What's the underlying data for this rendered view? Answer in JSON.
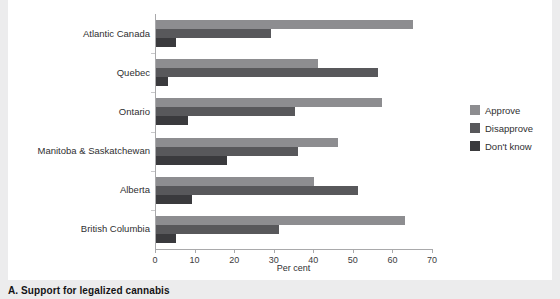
{
  "caption": "A. Support for legalized cannabis",
  "legend": {
    "position": "right",
    "items": [
      {
        "label": "Approve",
        "color": "#8d8d90",
        "swatch_name": "legend-swatch-approve"
      },
      {
        "label": "Disapprove",
        "color": "#58585b",
        "swatch_name": "legend-swatch-disapprove"
      },
      {
        "label": "Don't know",
        "color": "#3a3a3d",
        "swatch_name": "legend-swatch-dontknow"
      }
    ]
  },
  "chart_data": {
    "type": "bar",
    "orientation": "horizontal",
    "title": "",
    "subtitle": "",
    "xlabel": "Per cent",
    "ylabel": "",
    "xlim": [
      0,
      70
    ],
    "xticks": [
      0,
      10,
      20,
      30,
      40,
      50,
      60,
      70
    ],
    "xtick_labels": [
      "0",
      "10",
      "20",
      "30",
      "40",
      "50",
      "60",
      "70"
    ],
    "grid": false,
    "categories": [
      "Atlantic Canada",
      "Quebec",
      "Ontario",
      "Manitoba & Saskatchewan",
      "Alberta",
      "British Columbia"
    ],
    "series": [
      {
        "name": "Approve",
        "color": "#8d8d90",
        "values": [
          65,
          41,
          57,
          46,
          40,
          63
        ]
      },
      {
        "name": "Disapprove",
        "color": "#58585b",
        "values": [
          29,
          56,
          35,
          36,
          51,
          31
        ]
      },
      {
        "name": "Don't know",
        "color": "#3a3a3d",
        "values": [
          5,
          3,
          8,
          18,
          9,
          5
        ]
      }
    ]
  }
}
